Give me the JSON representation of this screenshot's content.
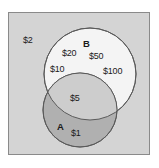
{
  "diagram": {
    "type": "venn",
    "title": "",
    "universe": {
      "name": "universe-rectangle",
      "fill_color": "#d4d4d4",
      "border_color": "#8a8a8a"
    },
    "sets": [
      {
        "id": "A",
        "label": "A",
        "fill_color": "#b0b0b0",
        "stroke_color": "#5a5a5a"
      },
      {
        "id": "B",
        "label": "B",
        "fill_color": "#f4f4f4",
        "stroke_color": "#5a5a5a"
      }
    ],
    "regions": {
      "outside_only": {
        "label": "outside-both-sets",
        "elements": [
          "$2"
        ]
      },
      "b_only": {
        "label": "set-b-only",
        "elements": [
          "$20",
          "$10",
          "$50",
          "$100"
        ]
      },
      "intersection": {
        "label": "a-intersect-b",
        "elements": [
          "$5"
        ]
      },
      "a_only": {
        "label": "set-a-only",
        "elements": [
          "$1"
        ]
      }
    },
    "elements": [
      {
        "id": "e-2",
        "text": "$2",
        "region": "outside_only"
      },
      {
        "id": "e-20",
        "text": "$20",
        "region": "b_only"
      },
      {
        "id": "e-10",
        "text": "$10",
        "region": "b_only"
      },
      {
        "id": "e-50",
        "text": "$50",
        "region": "b_only"
      },
      {
        "id": "e-100",
        "text": "$100",
        "region": "b_only"
      },
      {
        "id": "e-5",
        "text": "$5",
        "region": "intersection"
      },
      {
        "id": "e-1",
        "text": "$1",
        "region": "a_only"
      }
    ],
    "set_labels": {
      "a": "A",
      "b": "B"
    }
  }
}
